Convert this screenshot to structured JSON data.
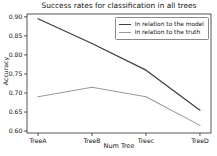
{
  "chart_data": {
    "type": "line",
    "title": "Success rates for classification in all trees",
    "xlabel": "Num Tree",
    "ylabel": "Accuracy",
    "categories": [
      "TreeA",
      "TreeB",
      "Treec",
      "TreeD"
    ],
    "series": [
      {
        "name": "In relation to the model",
        "color": "#3f3f3f",
        "values": [
          0.895,
          0.83,
          0.76,
          0.655
        ]
      },
      {
        "name": "In relation to the truth",
        "color": "#9a9a9a",
        "values": [
          0.69,
          0.715,
          0.69,
          0.615
        ]
      }
    ],
    "ylim": [
      0.6,
      0.9
    ],
    "yticks": [
      0.9,
      0.85,
      0.8,
      0.75,
      0.7,
      0.65,
      0.6
    ],
    "ytick_labels": [
      "0.90",
      "0.85",
      "0.80",
      "0.75",
      "0.70",
      "0.65",
      "0.60"
    ],
    "grid": false,
    "legend_position": "upper right",
    "frame_color": "#2b2b2b"
  }
}
